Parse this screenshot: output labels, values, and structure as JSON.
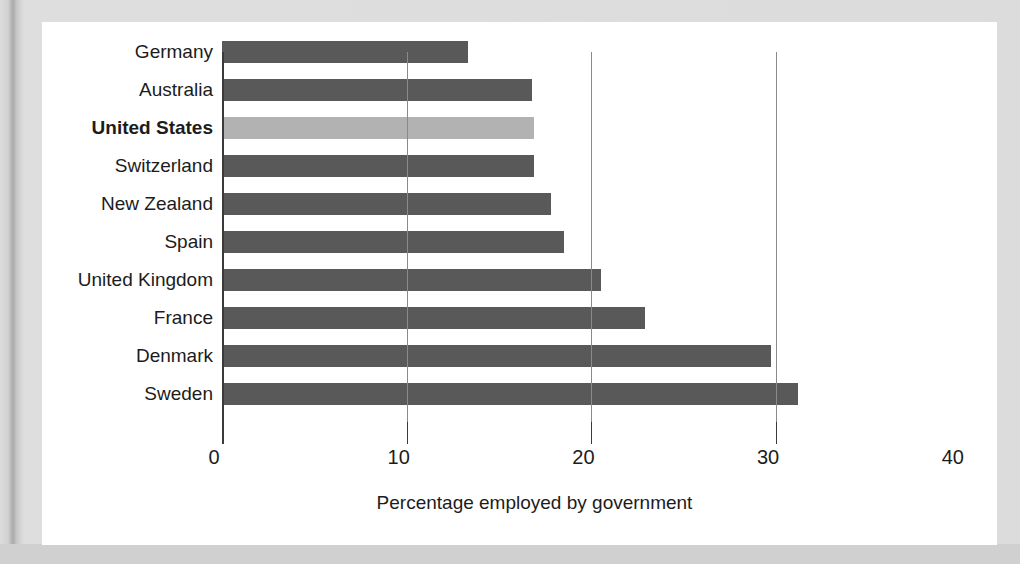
{
  "chart_data": {
    "type": "bar",
    "orientation": "horizontal",
    "title": "",
    "xlabel": "Percentage employed by government",
    "ylabel": "",
    "xlim": [
      0,
      40
    ],
    "xticks": [
      0,
      10,
      20,
      30,
      40
    ],
    "xtick_labels": [
      "0",
      "10",
      "20",
      "30",
      "40"
    ],
    "grid": "vertical gridlines at 10, 20, 30",
    "legend": "none",
    "categories": [
      "Germany",
      "Australia",
      "United States",
      "Switzerland",
      "New Zealand",
      "Spain",
      "United Kingdom",
      "France",
      "Denmark",
      "Sweden"
    ],
    "values": [
      13.3,
      16.8,
      16.9,
      16.9,
      17.8,
      18.5,
      20.5,
      22.9,
      29.7,
      31.2
    ],
    "highlighted_category": "United States",
    "colors": {
      "bar": "#595959",
      "bar_highlight": "#b2b2b2",
      "axis": "#3a3a3a",
      "gridline": "#8a8a8a",
      "panel_background": "#ffffff",
      "page_background": "#d5d5d5",
      "text": "#1c1c1c"
    }
  },
  "panel": {
    "axis_title": "Percentage employed by government"
  }
}
